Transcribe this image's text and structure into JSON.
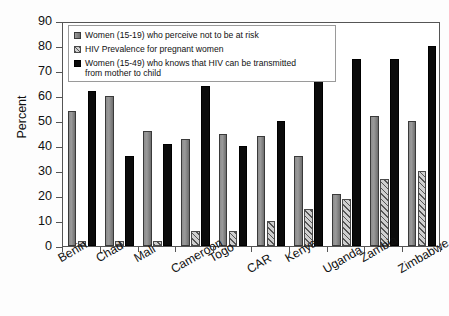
{
  "chart_data": {
    "type": "bar",
    "title": "",
    "xlabel": "",
    "ylabel": "Percent",
    "ylim": [
      0,
      90
    ],
    "yticks": [
      0,
      10,
      20,
      30,
      40,
      50,
      60,
      70,
      80,
      90
    ],
    "grid": false,
    "legend_position": "top-left-inside",
    "categories": [
      "Benin",
      "Chad",
      "Mali",
      "Cameroon",
      "Togo",
      "CAR",
      "Kenya",
      "Uganda",
      "Zambia",
      "Zimbabwe"
    ],
    "series": [
      {
        "name": "Women (15-19) who perceive not to be at risk",
        "color": "#8d8d8d",
        "values": [
          54,
          60,
          46,
          43,
          45,
          44,
          36,
          21,
          52,
          50
        ]
      },
      {
        "name": "HIV Prevalence for pregnant women",
        "color": "#cfcfcf",
        "values": [
          2,
          2,
          2,
          6,
          6,
          10,
          15,
          19,
          27,
          30
        ]
      },
      {
        "name": "Women (15-49) who knows that HIV can be transmitted from mother to child",
        "color": "#0b0b0b",
        "values": [
          62,
          36,
          41,
          64,
          40,
          50,
          70,
          75,
          75,
          80
        ]
      }
    ]
  },
  "legend": {
    "items": [
      "Women (15-19) who perceive not to be at risk",
      "HIV Prevalence for pregnant women",
      "Women (15-49) who knows that HIV can be transmitted\nfrom mother to child"
    ]
  },
  "axis": {
    "y_title": "Percent"
  }
}
